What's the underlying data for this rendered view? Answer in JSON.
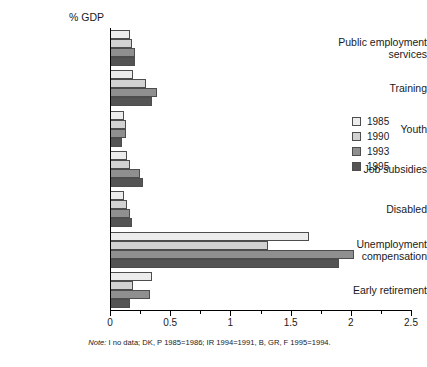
{
  "chart_data": {
    "type": "bar",
    "orientation": "horizontal",
    "title": "",
    "xlabel": "",
    "ylabel": "% GDP",
    "xlim": [
      0,
      2.5
    ],
    "xticks": [
      0,
      0.5,
      1,
      1.5,
      2,
      2.5
    ],
    "xticklabels": [
      "0",
      "0.5",
      "1",
      "1.5",
      "2",
      "2.5"
    ],
    "minor_xticks": [
      0.25,
      0.75,
      1.25,
      1.75,
      2.25
    ],
    "grid": false,
    "legend_position": "right",
    "categories": [
      "Public employment\nservices",
      "Training",
      "Youth",
      "Job subsidies",
      "Disabled",
      "Unemployment\ncompensation",
      "Early retirement"
    ],
    "series": [
      {
        "name": "1985",
        "color": "#ececec",
        "values": [
          0.17,
          0.19,
          0.12,
          0.14,
          0.12,
          1.65,
          0.35
        ]
      },
      {
        "name": "1990",
        "color": "#d2d2d2",
        "values": [
          0.18,
          0.3,
          0.13,
          0.17,
          0.14,
          1.31,
          0.19
        ]
      },
      {
        "name": "1993",
        "color": "#8f8f8f",
        "values": [
          0.21,
          0.39,
          0.13,
          0.25,
          0.17,
          2.03,
          0.33
        ]
      },
      {
        "name": "1995",
        "color": "#545454",
        "values": [
          0.21,
          0.35,
          0.1,
          0.27,
          0.18,
          1.9,
          0.17
        ]
      }
    ],
    "note_prefix": "Note:",
    "note": " I no data; DK, P 1985=1986; IR 1994=1991, B, GR, F 1995=1994."
  },
  "legend": {
    "items": [
      {
        "label": "1985",
        "color": "#ececec"
      },
      {
        "label": "1990",
        "color": "#d2d2d2"
      },
      {
        "label": "1993",
        "color": "#8f8f8f"
      },
      {
        "label": "1995",
        "color": "#545454"
      }
    ]
  }
}
